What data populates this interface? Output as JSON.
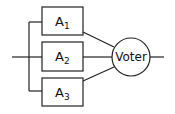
{
  "diagram": {
    "modules": [
      {
        "name": "A",
        "subscript": "1"
      },
      {
        "name": "A",
        "subscript": "2"
      },
      {
        "name": "A",
        "subscript": "3"
      }
    ],
    "voter": {
      "label": "Voter"
    }
  }
}
